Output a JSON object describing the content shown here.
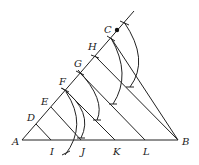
{
  "diagram": {
    "points": {
      "A": "A",
      "B": "B",
      "C": "C",
      "D": "D",
      "E": "E",
      "F": "F",
      "G": "G",
      "H": "H",
      "I": "I",
      "J": "J",
      "K": "K",
      "L": "L"
    },
    "stroke_color": "#222222"
  }
}
